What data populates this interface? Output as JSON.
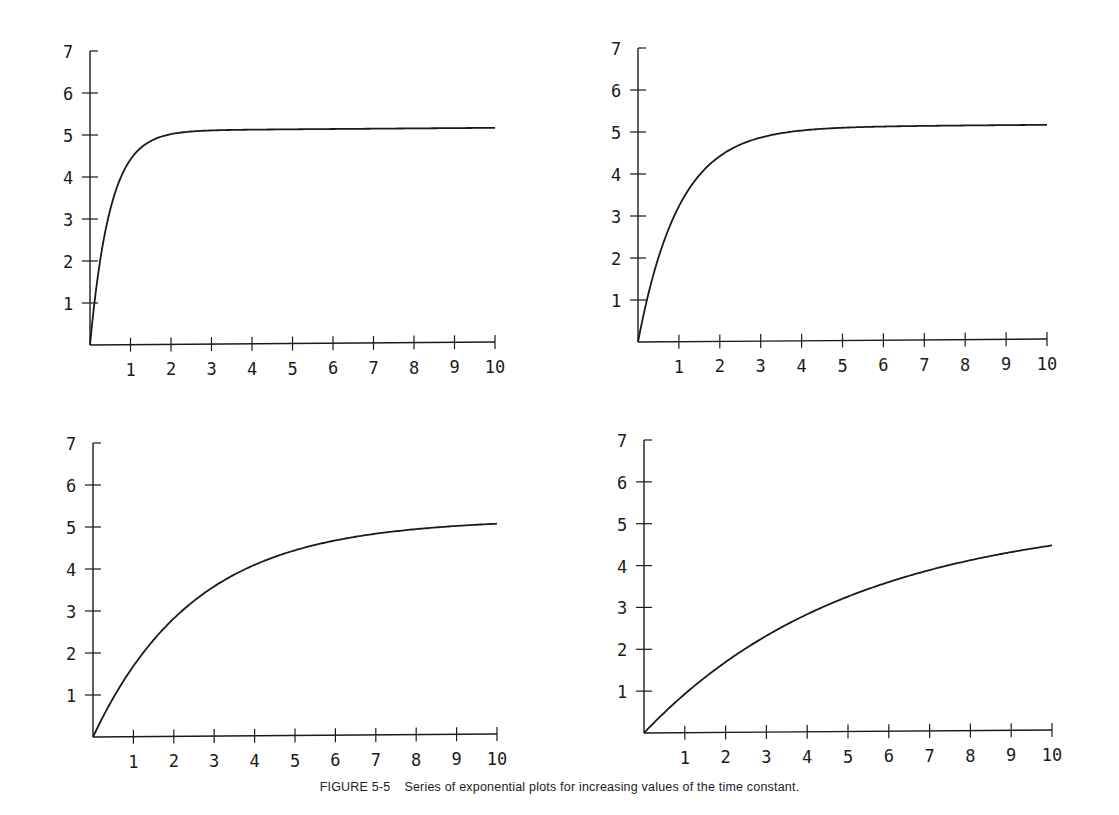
{
  "caption": {
    "figure_label": "FIGURE 5-5",
    "text": "Series of exponential plots for increasing values of the time constant."
  },
  "style": {
    "ink": "#1a1a1a",
    "background": "#ffffff"
  },
  "chart_data": [
    {
      "type": "line",
      "position": "top-left",
      "title": "",
      "xlabel": "",
      "ylabel": "",
      "xlim": [
        0,
        10
      ],
      "ylim": [
        0,
        7
      ],
      "x_ticks": [
        "1",
        "2",
        "3",
        "4",
        "5",
        "6",
        "7",
        "8",
        "9",
        "10"
      ],
      "y_ticks": [
        "1",
        "2",
        "3",
        "4",
        "5",
        "6",
        "7"
      ],
      "grid": false,
      "function": "y = 5(1 - e^(-x/0.5))",
      "time_constant": 0.5,
      "asymptote": 5,
      "x": [
        0,
        0.5,
        1,
        1.5,
        2,
        3,
        4,
        5,
        6,
        7,
        8,
        9,
        10
      ],
      "values": [
        0,
        3.16,
        4.32,
        4.75,
        4.91,
        4.99,
        5.0,
        5.0,
        5.0,
        5.0,
        5.0,
        5.0,
        5.0
      ],
      "box": {
        "ox": 90,
        "oy": 345,
        "xend": 495,
        "ytop": 51
      }
    },
    {
      "type": "line",
      "position": "top-right",
      "title": "",
      "xlabel": "",
      "ylabel": "",
      "xlim": [
        0,
        10
      ],
      "ylim": [
        0,
        7
      ],
      "x_ticks": [
        "1",
        "2",
        "3",
        "4",
        "5",
        "6",
        "7",
        "8",
        "9",
        "10"
      ],
      "y_ticks": [
        "1",
        "2",
        "3",
        "4",
        "5",
        "6",
        "7"
      ],
      "grid": false,
      "function": "y = 5(1 - e^(-x/1))",
      "time_constant": 1,
      "asymptote": 5,
      "x": [
        0,
        1,
        2,
        3,
        4,
        5,
        6,
        7,
        8,
        9,
        10
      ],
      "values": [
        0,
        3.16,
        4.32,
        4.75,
        4.91,
        4.97,
        4.99,
        5.0,
        5.0,
        5.0,
        5.0
      ],
      "box": {
        "ox": 638,
        "oy": 342,
        "xend": 1047,
        "ytop": 48
      }
    },
    {
      "type": "line",
      "position": "bottom-left",
      "title": "",
      "xlabel": "",
      "ylabel": "",
      "xlim": [
        0,
        10
      ],
      "ylim": [
        0,
        7
      ],
      "x_ticks": [
        "1",
        "2",
        "3",
        "4",
        "5",
        "6",
        "7",
        "8",
        "9",
        "10"
      ],
      "y_ticks": [
        "1",
        "2",
        "3",
        "4",
        "5",
        "6",
        "7"
      ],
      "grid": false,
      "function": "y = 5(1 - e^(-x/2.5))",
      "time_constant": 2.5,
      "asymptote": 5,
      "x": [
        0,
        1,
        2,
        3,
        4,
        5,
        6,
        7,
        8,
        9,
        10
      ],
      "values": [
        0,
        1.65,
        2.75,
        3.49,
        3.99,
        4.32,
        4.55,
        4.7,
        4.8,
        4.86,
        4.91
      ],
      "box": {
        "ox": 93,
        "oy": 737,
        "xend": 497,
        "ytop": 443
      }
    },
    {
      "type": "line",
      "position": "bottom-right",
      "title": "",
      "xlabel": "",
      "ylabel": "",
      "xlim": [
        0,
        10
      ],
      "ylim": [
        0,
        7
      ],
      "x_ticks": [
        "1",
        "2",
        "3",
        "4",
        "5",
        "6",
        "7",
        "8",
        "9",
        "10"
      ],
      "y_ticks": [
        "1",
        "2",
        "3",
        "4",
        "5",
        "6",
        "7"
      ],
      "grid": false,
      "function": "y = 5(1 - e^(-x/5))",
      "time_constant": 5,
      "asymptote": 5,
      "x": [
        0,
        1,
        2,
        3,
        4,
        5,
        6,
        7,
        8,
        9,
        10
      ],
      "values": [
        0,
        0.91,
        1.65,
        2.26,
        2.75,
        3.16,
        3.49,
        3.77,
        3.99,
        4.17,
        4.32
      ],
      "box": {
        "ox": 644,
        "oy": 733,
        "xend": 1052,
        "ytop": 440
      }
    }
  ]
}
